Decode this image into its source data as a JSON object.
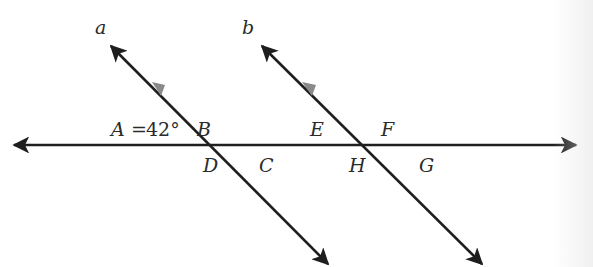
{
  "diagram": {
    "colors": {
      "line": "#1e1e1e",
      "marker": "#8a8a8a",
      "label": "#2a2a2a",
      "background": "#ffffff"
    },
    "lines": {
      "a": {
        "label": "a"
      },
      "b": {
        "label": "b"
      },
      "transversal": {
        "label": ""
      }
    },
    "angle_labels": {
      "A": {
        "name": "A",
        "equals": "=",
        "value": "42°"
      },
      "B": "B",
      "C": "C",
      "D": "D",
      "E": "E",
      "F": "F",
      "G": "G",
      "H": "H"
    },
    "given": "A = 42°",
    "parallel_marker": "single arrowhead on a and b"
  }
}
